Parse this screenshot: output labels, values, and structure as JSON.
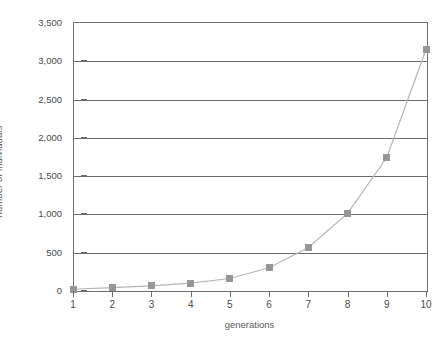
{
  "chart_data": {
    "type": "line",
    "title": "",
    "xlabel": "generations",
    "ylabel": "number of individuals",
    "x": [
      1,
      2,
      3,
      4,
      5,
      6,
      7,
      8,
      9,
      10
    ],
    "xtick_labels": [
      "1",
      "2",
      "3",
      "4",
      "5",
      "6",
      "7",
      "8",
      "9",
      "10"
    ],
    "ytick_labels": [
      "0",
      "500",
      "1,000",
      "1,500",
      "2,000",
      "2,500",
      "3,000",
      "3,500"
    ],
    "yticks": [
      0,
      500,
      1000,
      1500,
      2000,
      2500,
      3000,
      3500
    ],
    "xlim": [
      1,
      10
    ],
    "ylim": [
      0,
      3500
    ],
    "grid": "horizontal",
    "legend": "none",
    "series": [
      {
        "name": "number of individuals",
        "values": [
          10,
          30,
          55,
          90,
          150,
          290,
          555,
          1000,
          1730,
          3140
        ],
        "marker": "square",
        "marker_color": "#969696",
        "line_color": "#b5b5b5"
      }
    ]
  },
  "axis_color": "#6b6b6b",
  "text_color": "#4a4a4a"
}
